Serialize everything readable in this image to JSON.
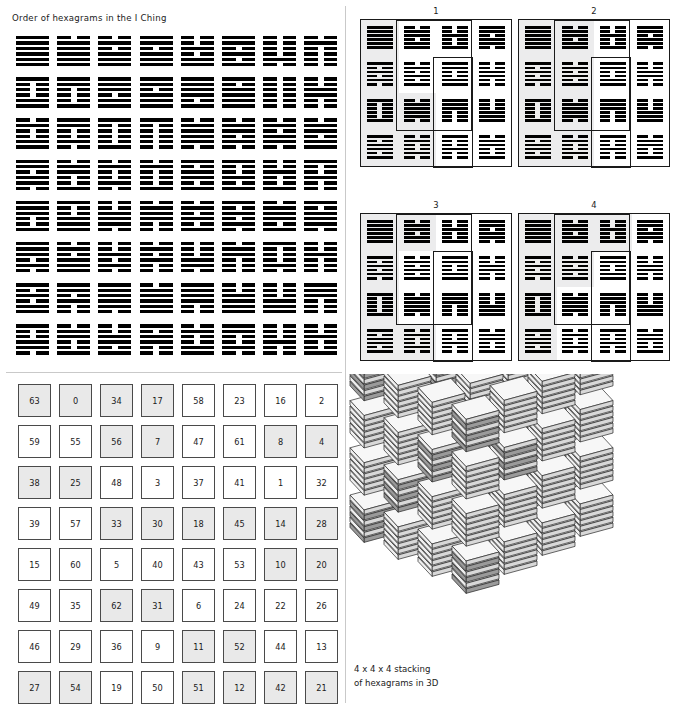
{
  "canvas": {
    "width": 677,
    "height": 709,
    "background": "#ffffff"
  },
  "colors": {
    "ink": "#000000",
    "text": "#1a1a1a",
    "cell_border": "#4a4a4a",
    "cell_shaded": "#e9e9e9",
    "quad_shaded": "#ececed",
    "divider": "#c9c9c9",
    "face_top": "#f7f7f7",
    "face_side": "#d8d8d8",
    "face_dark": "#9a9a9a"
  },
  "order_panel": {
    "title": "Order of hexagrams in the I Ching",
    "rows": 8,
    "cols": 8,
    "line_legend": {
      "yang": "solid line",
      "yin": "broken line"
    },
    "hexagrams": [
      [
        "111111",
        "011111",
        "010111",
        "110111",
        "001011",
        "110101",
        "000010",
        "010000"
      ],
      [
        "100011",
        "110001",
        "111011",
        "110111",
        "111101",
        "101111",
        "000000",
        "001100"
      ],
      [
        "010011",
        "110010",
        "100001",
        "100000",
        "011110",
        "011010",
        "010110",
        "011011"
      ],
      [
        "110110",
        "011001",
        "010010",
        "010001",
        "101101",
        "100101",
        "001001",
        "100100"
      ],
      [
        "111001",
        "100111",
        "001110",
        "011100",
        "010101",
        "101010",
        "011101",
        "101110"
      ],
      [
        "111010",
        "010111",
        "001010",
        "010100",
        "000110",
        "011000",
        "100010",
        "001000"
      ],
      [
        "101011",
        "110100",
        "111110",
        "011111",
        "111100",
        "001111",
        "000111",
        "111000"
      ],
      [
        "100110",
        "011001",
        "001101",
        "101100",
        "010011",
        "110010",
        "000100",
        "001001"
      ]
    ]
  },
  "four_panel": {
    "quads": [
      {
        "label": "1",
        "shaded_cells": [
          0,
          4,
          8,
          9,
          12,
          13
        ],
        "highlights": [
          {
            "left": 35,
            "top": 0,
            "width": 76,
            "height": 111
          },
          {
            "left": 72,
            "top": 37,
            "width": 40,
            "height": 111
          },
          {
            "left": 0,
            "top": 0,
            "width": 152,
            "height": 148
          }
        ]
      },
      {
        "label": "2",
        "shaded_cells": [
          0,
          1,
          4,
          5,
          8,
          9,
          12,
          13
        ],
        "highlights": [
          {
            "left": 35,
            "top": 0,
            "width": 76,
            "height": 111
          },
          {
            "left": 72,
            "top": 37,
            "width": 40,
            "height": 111
          },
          {
            "left": 0,
            "top": 0,
            "width": 152,
            "height": 148
          }
        ]
      },
      {
        "label": "3",
        "shaded_cells": [
          0,
          1,
          4,
          8,
          12,
          13
        ],
        "highlights": [
          {
            "left": 35,
            "top": 0,
            "width": 76,
            "height": 111
          },
          {
            "left": 72,
            "top": 37,
            "width": 40,
            "height": 111
          },
          {
            "left": 0,
            "top": 0,
            "width": 152,
            "height": 148
          }
        ]
      },
      {
        "label": "4",
        "shaded_cells": [
          0,
          1,
          2,
          4,
          5,
          8,
          12
        ],
        "highlights": [
          {
            "left": 35,
            "top": 0,
            "width": 76,
            "height": 111
          },
          {
            "left": 72,
            "top": 37,
            "width": 40,
            "height": 111
          },
          {
            "left": 0,
            "top": 0,
            "width": 152,
            "height": 148
          }
        ]
      }
    ],
    "cell_hexagrams": [
      [
        "111111",
        "011011",
        "001001",
        "110110"
      ],
      [
        "101010",
        "010101",
        "110011",
        "001100"
      ],
      [
        "100001",
        "011110",
        "111000",
        "000111"
      ],
      [
        "101101",
        "010010",
        "100100",
        "011001"
      ]
    ]
  },
  "number_panel": {
    "rows": 8,
    "cols": 8,
    "values": [
      [
        63,
        0,
        34,
        17,
        58,
        23,
        16,
        2
      ],
      [
        59,
        55,
        56,
        7,
        47,
        61,
        8,
        4
      ],
      [
        38,
        25,
        48,
        3,
        37,
        41,
        1,
        32
      ],
      [
        39,
        57,
        33,
        30,
        18,
        45,
        14,
        28
      ],
      [
        15,
        60,
        5,
        40,
        43,
        53,
        10,
        20
      ],
      [
        49,
        35,
        62,
        31,
        6,
        24,
        22,
        26
      ],
      [
        46,
        29,
        36,
        9,
        11,
        52,
        44,
        13
      ],
      [
        27,
        54,
        19,
        50,
        51,
        12,
        42,
        21
      ]
    ],
    "shaded": [
      [
        true,
        true,
        true,
        true,
        false,
        false,
        false,
        false
      ],
      [
        false,
        false,
        true,
        true,
        false,
        false,
        true,
        true
      ],
      [
        true,
        true,
        false,
        false,
        false,
        false,
        false,
        false
      ],
      [
        false,
        false,
        true,
        true,
        true,
        true,
        true,
        true
      ],
      [
        false,
        false,
        false,
        false,
        false,
        false,
        true,
        true
      ],
      [
        false,
        false,
        true,
        true,
        false,
        false,
        false,
        false
      ],
      [
        false,
        false,
        false,
        false,
        true,
        true,
        false,
        false
      ],
      [
        true,
        true,
        false,
        false,
        true,
        true,
        true,
        true
      ]
    ]
  },
  "stack_panel": {
    "caption": "4 x 4 x 4 stacking\nof hexagrams in 3D",
    "dimensions": {
      "x": 4,
      "y": 4,
      "z": 4
    },
    "total_stacks": 64,
    "slabs_per_stack": 6
  }
}
